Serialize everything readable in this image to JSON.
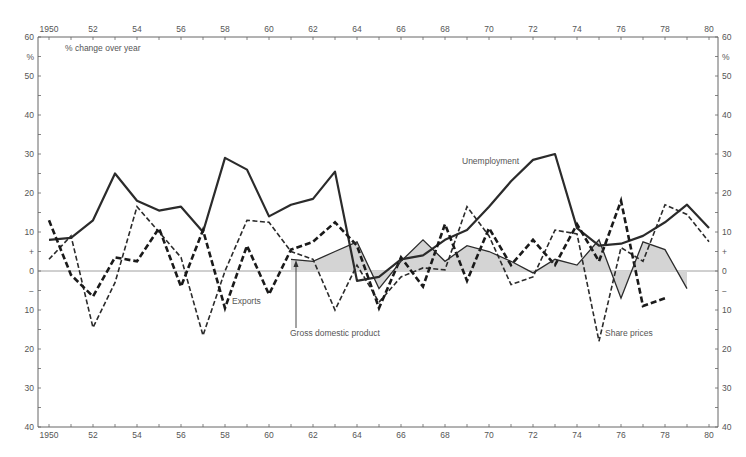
{
  "chart_data": {
    "type": "line",
    "title": "",
    "annotation": "% change over year",
    "xlabel": "",
    "ylabel": "%",
    "xlim": [
      1950,
      1980
    ],
    "ylim": [
      -40,
      60
    ],
    "grid": false,
    "x_ticks": [
      "1950",
      "52",
      "54",
      "56",
      "58",
      "60",
      "62",
      "64",
      "66",
      "68",
      "70",
      "72",
      "74",
      "76",
      "78",
      "80"
    ],
    "y_ticks": [
      {
        "v": 60,
        "label": "60"
      },
      {
        "v": 55,
        "label": "%"
      },
      {
        "v": 50,
        "label": "50"
      },
      {
        "v": 40,
        "label": "40"
      },
      {
        "v": 30,
        "label": "30"
      },
      {
        "v": 20,
        "label": "20"
      },
      {
        "v": 10,
        "label": "10"
      },
      {
        "v": 5,
        "label": "+"
      },
      {
        "v": 0,
        "label": "0"
      },
      {
        "v": -5,
        "label": "−"
      },
      {
        "v": -10,
        "label": "10"
      },
      {
        "v": -20,
        "label": "20"
      },
      {
        "v": -30,
        "label": "30"
      },
      {
        "v": -40,
        "label": "40"
      }
    ],
    "series": [
      {
        "name": "Unemployment",
        "style": "solid-thick",
        "x_start": 1950,
        "values": [
          8,
          8.5,
          13,
          25,
          18,
          15.5,
          16.5,
          10,
          29,
          26,
          14,
          17,
          18.5,
          25.5,
          -2.5,
          -1.5,
          3,
          4,
          8,
          10.5,
          16.5,
          23,
          28.5,
          30,
          11,
          6.5,
          7,
          9,
          12.5,
          17,
          11
        ]
      },
      {
        "name": "Exports",
        "style": "dashed-thin",
        "x_start": 1950,
        "values": [
          3,
          9,
          -14.5,
          -3,
          16.5,
          10,
          3.5,
          -16.5,
          0,
          13,
          12.5,
          5,
          3,
          -10,
          1.5,
          -8,
          -1.5,
          0.8,
          0.3,
          16.5,
          9,
          -3.5,
          -1.5,
          10.5,
          9.5,
          -18,
          6,
          2.5,
          17,
          14.5,
          7.5
        ]
      },
      {
        "name": "Share prices",
        "style": "dashed-thick",
        "x_start": 1950,
        "values": [
          13,
          -1,
          -6.5,
          3.5,
          2.5,
          11,
          -4,
          10.5,
          -9.5,
          6.5,
          -6,
          5.5,
          7.5,
          12.5,
          6.5,
          -9.5,
          3.5,
          -4,
          12,
          -2.5,
          11,
          1.5,
          8,
          1.5,
          12,
          2.5,
          18,
          -9,
          -7
        ]
      },
      {
        "name": "Gross domestic product",
        "style": "solid-thin-filled",
        "x_start": 1961,
        "values": [
          3,
          2.5,
          5,
          7.5,
          -4.5,
          2.5,
          8,
          2.5,
          6.5,
          5,
          2.5,
          -0.5,
          3,
          1.5,
          8,
          -7,
          7.5,
          5.5,
          -4.5
        ]
      }
    ],
    "labels": {
      "unemployment": "Unemployment",
      "exports": "Exports",
      "gdp": "Gross domestic product",
      "share_prices": "Share prices"
    }
  },
  "colors": {
    "line": "#2b2b2b",
    "axis": "#666666",
    "fill": "#d4d4d4"
  }
}
